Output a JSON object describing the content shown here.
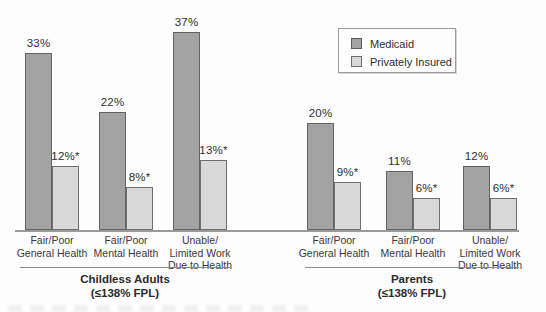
{
  "legend": {
    "items": [
      {
        "label": "Medicaid",
        "fill": "#a3a3a3",
        "border": "#5d5d5d"
      },
      {
        "label": "Privately Insured",
        "fill": "#d9d9d9",
        "border": "#6f6f6f"
      }
    ]
  },
  "chart_data": {
    "type": "bar",
    "title": "",
    "xlabel": "",
    "ylabel": "",
    "value_unit": "%",
    "ylim": [
      0,
      43
    ],
    "grid": false,
    "legend_position": "top-right",
    "series": [
      "Medicaid",
      "Privately Insured"
    ],
    "series_colors": [
      "#a3a3a3",
      "#d9d9d9"
    ],
    "groups": [
      {
        "name": "Childless Adults",
        "name_sub": "(≤138% FPL)",
        "categories": [
          {
            "lines": [
              "Fair/Poor",
              "General Health"
            ],
            "values": [
              33,
              12
            ],
            "labels": [
              "33%",
              "12%*"
            ]
          },
          {
            "lines": [
              "Fair/Poor",
              "Mental Health"
            ],
            "values": [
              22,
              8
            ],
            "labels": [
              "22%",
              "8%*"
            ]
          },
          {
            "lines": [
              "Unable/",
              "Limited Work",
              "Due to Health"
            ],
            "values": [
              37,
              13
            ],
            "labels": [
              "37%",
              "13%*"
            ]
          }
        ]
      },
      {
        "name": "Parents",
        "name_sub": "(≤138% FPL)",
        "categories": [
          {
            "lines": [
              "Fair/Poor",
              "General Health"
            ],
            "values": [
              20,
              9
            ],
            "labels": [
              "20%",
              "9%*"
            ]
          },
          {
            "lines": [
              "Fair/Poor",
              "Mental Health"
            ],
            "values": [
              11,
              6
            ],
            "labels": [
              "11%",
              "6%*"
            ]
          },
          {
            "lines": [
              "Unable/",
              "Limited Work",
              "Due to Health"
            ],
            "values": [
              12,
              6
            ],
            "labels": [
              "12%",
              "6%*"
            ]
          }
        ]
      }
    ]
  }
}
